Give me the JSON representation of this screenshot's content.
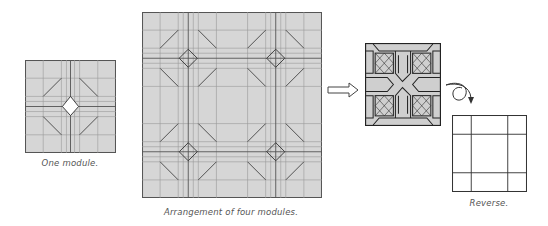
{
  "captions": {
    "one_module": "One module.",
    "arrangement": "Arrangement of four modules.",
    "reverse": "Reverse."
  },
  "colors": {
    "paper": "#d6d6d6",
    "crease": "#8a8a8a",
    "fold": "#333333",
    "white": "#ffffff",
    "folded_fill": "#cfcfcf"
  },
  "figures": [
    {
      "id": "one-module",
      "x": 25,
      "y": 60,
      "w": 90,
      "h": 92
    },
    {
      "id": "four-modules",
      "x": 142,
      "y": 12,
      "w": 179,
      "h": 185
    },
    {
      "id": "arrow",
      "x": 327,
      "y": 82
    },
    {
      "id": "folded-model",
      "x": 365,
      "y": 43,
      "w": 75,
      "h": 82
    },
    {
      "id": "reverse-arrow",
      "x": 444,
      "y": 82
    },
    {
      "id": "reverse-view",
      "x": 452,
      "y": 115,
      "w": 74,
      "h": 76
    }
  ]
}
